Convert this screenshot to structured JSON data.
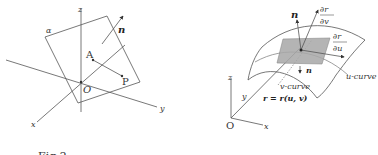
{
  "figure_caption": "Fig.2",
  "left_diagram": {
    "axis_x": "x",
    "axis_y": "y",
    "axis_z": "z",
    "origin": "O",
    "plane_label": "α",
    "point_a": "A",
    "point_p": "P",
    "normal": "n"
  },
  "right_diagram": {
    "axis_x": "x",
    "axis_y": "y",
    "axis_z": "z",
    "origin": "O",
    "normal_top": "n",
    "normal_bottom": "n",
    "partial_num_v": "∂r",
    "partial_den_v": "∂v",
    "partial_num_u": "∂r",
    "partial_den_u": "∂u",
    "u_curve": "u-curve",
    "v_curve": "v-curve",
    "position_eq": "r = r(u, v)"
  },
  "colors": {
    "line": "#555555",
    "tangent_patch": "#a8a8a8",
    "background": "#ffffff"
  }
}
